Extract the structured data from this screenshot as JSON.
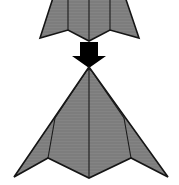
{
  "diagram": {
    "title": "Origami fold step diagram",
    "canvas": {
      "width": 179,
      "height": 185,
      "background_color": "#ffffff"
    },
    "colors": {
      "paper_fill": "#7d7d7d",
      "paper_fill_light": "#848484",
      "paper_outline": "#151515",
      "crease_line": "#1b1b1b",
      "arrow_fill": "#000000",
      "background": "#ffffff"
    },
    "shapes": [
      {
        "name": "upper-dart",
        "label": "Upper folded paper dart (before fold)",
        "state": "before",
        "fill": "#7d7d7d",
        "outline_points": "62,-30 116,-30 139,38 110,30 89,41 68,30 40,38",
        "creases": [
          "68,-30 68,30",
          "89,-30 89,41",
          "110,-30 110,30"
        ]
      },
      {
        "name": "lower-dart",
        "label": "Lower folded paper dart (after fold)",
        "state": "after",
        "fill": "#7d7d7d",
        "outline_points": "89,67 168,177 131,158 89,178 48,158 14,177",
        "creases": [
          "89,67 89,178",
          "55,121 48,158",
          "124,121 131,158",
          "89,67 70,84",
          "89,67 108,84"
        ]
      }
    ],
    "arrow": {
      "name": "fold-direction-arrow",
      "label": "Downward fold direction arrow",
      "fill": "#000000",
      "direction": "down",
      "points": "80,42 98,42 98,56 106,56 89,68 72,56 80,56"
    }
  },
  "chart_data": {
    "type": "diagram",
    "title": "Origami fold step"
  }
}
